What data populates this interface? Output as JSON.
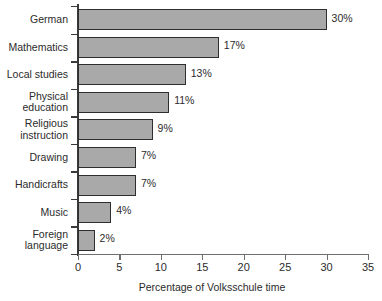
{
  "chart_data": {
    "type": "bar",
    "orientation": "horizontal",
    "title": "",
    "xlabel": "Percentage of Volksschule time",
    "ylabel": "",
    "xlim": [
      0,
      35
    ],
    "xticks": [
      0,
      5,
      10,
      15,
      20,
      25,
      30,
      35
    ],
    "grid": false,
    "legend": false,
    "categories": [
      "German",
      "Mathematics",
      "Local studies",
      "Physical education",
      "Religious instruction",
      "Drawing",
      "Handicrafts",
      "Music",
      "Foreign language"
    ],
    "values": [
      30,
      17,
      13,
      11,
      9,
      7,
      7,
      4,
      2
    ],
    "data_labels": [
      "30%",
      "17%",
      "13%",
      "11%",
      "9%",
      "7%",
      "7%",
      "4%",
      "2%"
    ],
    "bar_fill_color": "#a9a9a9",
    "bar_edge_color": "#2e2e2e",
    "background_color": "#ffffff"
  },
  "y_label_lines": [
    [
      "German"
    ],
    [
      "Mathematics"
    ],
    [
      "Local studies"
    ],
    [
      "Physical",
      "education"
    ],
    [
      "Religious",
      "instruction"
    ],
    [
      "Drawing"
    ],
    [
      "Handicrafts"
    ],
    [
      "Music"
    ],
    [
      "Foreign",
      "language"
    ]
  ]
}
